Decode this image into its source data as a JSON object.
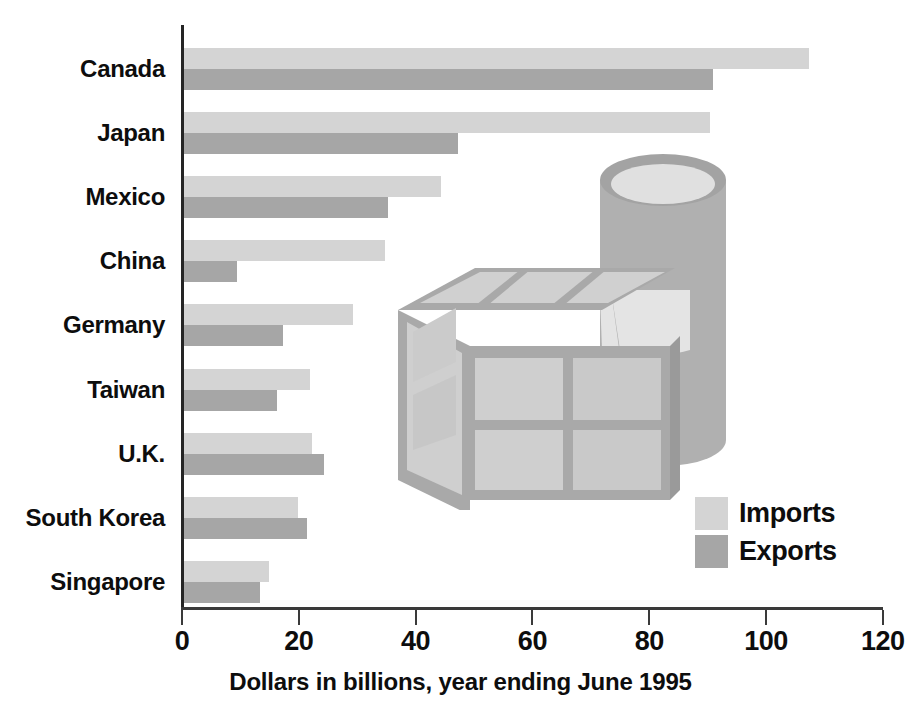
{
  "chart_data": {
    "type": "bar",
    "orientation": "horizontal",
    "title": "",
    "xlabel": "Dollars in billions, year ending June 1995",
    "ylabel": "",
    "xlim": [
      0,
      120
    ],
    "xticks": [
      0,
      20,
      40,
      60,
      80,
      100,
      120
    ],
    "xtick_labels": [
      "0",
      "20",
      "40",
      "60",
      "80",
      "100",
      "120"
    ],
    "grid": false,
    "legend_position": "inside-right",
    "categories": [
      "Canada",
      "Japan",
      "Mexico",
      "China",
      "Germany",
      "Taiwan",
      "U.K.",
      "South Korea",
      "Singapore"
    ],
    "series": [
      {
        "name": "Imports",
        "color": "#d4d4d4",
        "values": [
          107,
          90,
          44,
          34.5,
          29,
          21.5,
          22,
          19.5,
          14.5
        ]
      },
      {
        "name": "Exports",
        "color": "#a6a6a6",
        "values": [
          90.5,
          47,
          35,
          9,
          17,
          16,
          24,
          21,
          13
        ]
      }
    ],
    "legend": [
      {
        "label": "Imports",
        "color": "#d4d4d4"
      },
      {
        "label": "Exports",
        "color": "#a6a6a6"
      }
    ],
    "annotations": [
      {
        "name": "crate-illustration",
        "description": "shipping crate and barrel artwork"
      }
    ]
  },
  "axis": {
    "x_title": "Dollars in billions, year ending June 1995"
  },
  "legend": {
    "imports_label": "Imports",
    "exports_label": "Exports"
  },
  "colors": {
    "imports": "#d4d4d4",
    "exports": "#a6a6a6",
    "axis": "#252525",
    "text": "#0d0d0d",
    "illustration_light": "#dcdcdc",
    "illustration_mid": "#c2c2c2",
    "illustration_dark": "#a3a3a3"
  }
}
